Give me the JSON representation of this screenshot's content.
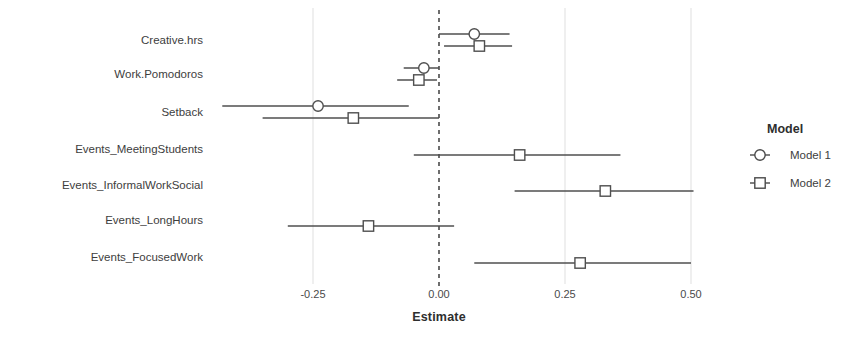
{
  "chart_data": {
    "type": "scatter",
    "subtype": "forest-plot",
    "title": "",
    "xlabel": "Estimate",
    "ylabel": "",
    "xlim": [
      -0.34,
      0.56
    ],
    "xticks": [
      -0.25,
      0.0,
      0.25,
      0.5
    ],
    "xtick_labels": [
      "-0.25",
      "0.00",
      "0.25",
      "0.50"
    ],
    "grid": true,
    "grid_axis": "x",
    "reference_line": {
      "x": 0.0,
      "style": "dashed",
      "color": "#4a4a4a"
    },
    "legend": {
      "title": "Model",
      "position": "right"
    },
    "categories": [
      "Creative.hrs",
      "Work.Pomodoros",
      "Setback",
      "Events_MeetingStudents",
      "Events_InformalWorkSocial",
      "Events_LongHours",
      "Events_FocusedWork"
    ],
    "series": [
      {
        "name": "Model 1",
        "marker": "circle",
        "color": "#4f4f4f",
        "points": [
          {
            "category": "Creative.hrs",
            "estimate": 0.07,
            "low": 0.0,
            "high": 0.14
          },
          {
            "category": "Work.Pomodoros",
            "estimate": -0.03,
            "low": -0.07,
            "high": 0.0
          },
          {
            "category": "Setback",
            "estimate": -0.24,
            "low": -0.43,
            "high": -0.06
          },
          {
            "category": "Events_MeetingStudents",
            "estimate": null,
            "low": null,
            "high": null
          },
          {
            "category": "Events_InformalWorkSocial",
            "estimate": null,
            "low": null,
            "high": null
          },
          {
            "category": "Events_LongHours",
            "estimate": null,
            "low": null,
            "high": null
          },
          {
            "category": "Events_FocusedWork",
            "estimate": null,
            "low": null,
            "high": null
          }
        ]
      },
      {
        "name": "Model 2",
        "marker": "square",
        "color": "#4f4f4f",
        "points": [
          {
            "category": "Creative.hrs",
            "estimate": 0.08,
            "low": 0.01,
            "high": 0.145
          },
          {
            "category": "Work.Pomodoros",
            "estimate": -0.04,
            "low": -0.083,
            "high": -0.004
          },
          {
            "category": "Setback",
            "estimate": -0.17,
            "low": -0.35,
            "high": 0.0
          },
          {
            "category": "Events_MeetingStudents",
            "estimate": 0.16,
            "low": -0.05,
            "high": 0.36
          },
          {
            "category": "Events_InformalWorkSocial",
            "estimate": 0.33,
            "low": 0.15,
            "high": 0.505
          },
          {
            "category": "Events_LongHours",
            "estimate": -0.14,
            "low": -0.3,
            "high": 0.03
          },
          {
            "category": "Events_FocusedWork",
            "estimate": 0.28,
            "low": 0.07,
            "high": 0.5
          }
        ]
      }
    ]
  },
  "axis": {
    "x_title": "Estimate"
  },
  "legend": {
    "title": "Model",
    "entries": [
      {
        "label": "Model 1",
        "marker": "circle-marker-icon"
      },
      {
        "label": "Model 2",
        "marker": "square-marker-icon"
      }
    ]
  }
}
